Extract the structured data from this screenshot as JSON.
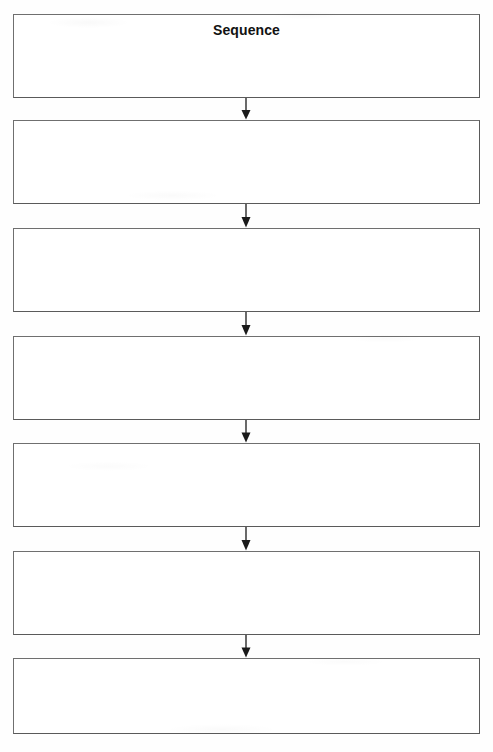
{
  "worksheet": {
    "title": "Sequence",
    "type": "sequence-graphic-organizer",
    "layout": {
      "page_width": 493,
      "page_height": 752,
      "box_count": 7,
      "box_left": 13,
      "box_width": 467,
      "box_height": 84,
      "box_tops": [
        14,
        120,
        228,
        336,
        443,
        551,
        658
      ],
      "connector_center_x": 246,
      "connector_gap": 24
    },
    "colors": {
      "page_background": "#fefefe",
      "box_fill": "#ffffff",
      "box_border": "#6f6f6f",
      "box_border_shadow": "#5a5a5a",
      "text": "#121212",
      "arrow": "#1a1a1a"
    },
    "boxes": [
      {
        "title": "Sequence",
        "text": ""
      },
      {
        "title": "",
        "text": ""
      },
      {
        "title": "",
        "text": ""
      },
      {
        "title": "",
        "text": ""
      },
      {
        "title": "",
        "text": ""
      },
      {
        "title": "",
        "text": ""
      },
      {
        "title": "",
        "text": ""
      }
    ],
    "connectors": [
      {
        "icon": "arrow-down-icon"
      },
      {
        "icon": "arrow-down-icon"
      },
      {
        "icon": "arrow-down-icon"
      },
      {
        "icon": "arrow-down-icon"
      },
      {
        "icon": "arrow-down-icon"
      },
      {
        "icon": "arrow-down-icon"
      }
    ]
  }
}
